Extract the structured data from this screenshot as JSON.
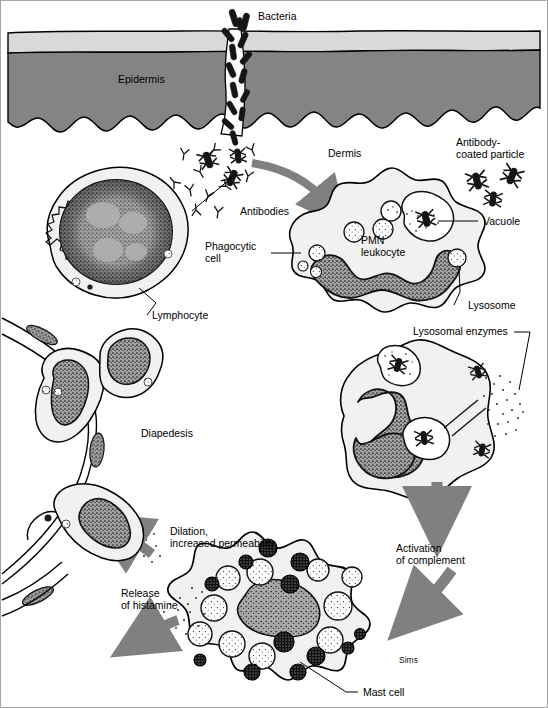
{
  "figure": {
    "domain": "biology-illustration",
    "signature": "Sims",
    "background_color": "#ffffff",
    "frame_color": "#9a9a9a"
  },
  "palette": {
    "stratum_corneum": "#d9d9d9",
    "epidermis_fill": "#848484",
    "arrow_gray": "#808080",
    "cell_cytoplasm": "#f1f1ef",
    "nucleus_fill": "#9d9d9d",
    "outline": "#000000",
    "granule_dark": "#1b1b1b",
    "granule_light": "#ffffff"
  },
  "labels": {
    "bacteria": "Bacteria",
    "epidermis": "Epidermis",
    "dermis": "Dermis",
    "antibody_coated_particle_line1": "Antibody-",
    "antibody_coated_particle_line2": "coated particle",
    "antibodies": "Antibodies",
    "vacuole": "Vacuole",
    "phagocytic_cell_line1": "Phagocytic",
    "phagocytic_cell_line2": "cell",
    "pmn_leukocyte_line1": "PMN",
    "pmn_leukocyte_line2": "leukocyte",
    "lysosome": "Lysosome",
    "lymphocyte": "Lymphocyte",
    "lysosomal_enzymes": "Lysosomal enzymes",
    "diapedesis": "Diapedesis",
    "dilation_line1": "Dilation,",
    "dilation_line2": "increased permeability",
    "activation_line1": "Activation",
    "activation_line2": "of complement",
    "release_histamine_line1": "Release",
    "release_histamine_line2": "of histamine",
    "mast_cell": "Mast cell",
    "signature": "Sims"
  },
  "structures": [
    {
      "name": "bacteria-cluster",
      "description": "rod-shaped bacteria entering wound in skin"
    },
    {
      "name": "epidermis-layer",
      "description": "banded skin layers with wavy dermal-epidermal junction"
    },
    {
      "name": "lymphocyte-cell",
      "description": "round cell with large stippled nucleus"
    },
    {
      "name": "pmn-leukocyte-cell",
      "description": "phagocytic cell with multilobed nucleus, lysosomes, vacuole"
    },
    {
      "name": "phagolysosome-cell",
      "description": "cell releasing lysosomal enzymes"
    },
    {
      "name": "mast-cell",
      "description": "cell packed with dark and light granules releasing histamine"
    },
    {
      "name": "diapedesis-vessel",
      "description": "leukocytes squeezing through a blood vessel wall"
    }
  ],
  "flow_arrows": [
    {
      "name": "arrow-to-pmn",
      "from": "antibodies/bacteria",
      "to": "PMN leukocyte"
    },
    {
      "name": "arrow-pmn-to-phagolysosome",
      "from": "PMN leukocyte",
      "to": "phagolysosome"
    },
    {
      "name": "arrow-to-complement",
      "from": "phagolysosome",
      "to": "activation of complement"
    },
    {
      "name": "arrow-complement-to-mast",
      "from": "activation of complement",
      "to": "mast cell"
    },
    {
      "name": "arrow-histamine-out",
      "from": "mast cell",
      "to": "release of histamine"
    },
    {
      "name": "arrow-dilation",
      "from": "histamine",
      "to": "dilation, increased permeability"
    }
  ]
}
